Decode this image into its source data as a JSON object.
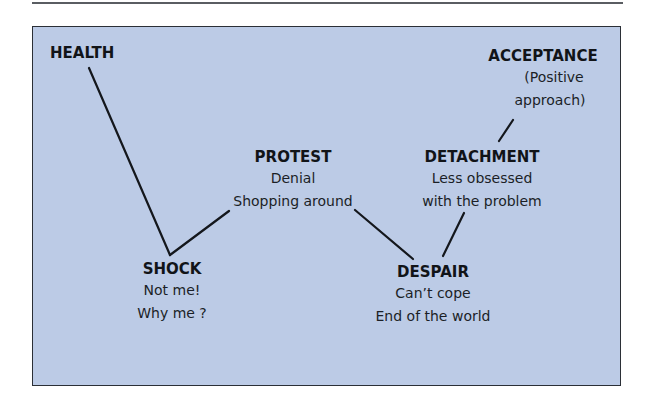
{
  "diagram": {
    "type": "stage-progression",
    "colors": {
      "background": "#bccbe6",
      "frame": "#2b2f36",
      "text": "#111418",
      "line": "#14171c"
    },
    "nodes": [
      {
        "id": "health",
        "title": "HEALTH",
        "lines": []
      },
      {
        "id": "shock",
        "title": "SHOCK",
        "lines": [
          "Not me!",
          "Why me ?"
        ]
      },
      {
        "id": "protest",
        "title": "PROTEST",
        "lines": [
          "Denial",
          "Shopping around"
        ]
      },
      {
        "id": "despair",
        "title": "DESPAIR",
        "lines": [
          "Can’t cope",
          "End of the world"
        ]
      },
      {
        "id": "detachment",
        "title": "DETACHMENT",
        "lines": [
          "Less obsessed",
          "with the problem"
        ]
      },
      {
        "id": "acceptance",
        "title": "ACCEPTANCE",
        "lines": [
          "(Positive",
          "approach)"
        ]
      }
    ],
    "edges": [
      {
        "from": "health",
        "to": "shock"
      },
      {
        "from": "shock",
        "to": "protest"
      },
      {
        "from": "protest",
        "to": "despair"
      },
      {
        "from": "despair",
        "to": "detachment"
      },
      {
        "from": "detachment",
        "to": "acceptance"
      }
    ]
  }
}
